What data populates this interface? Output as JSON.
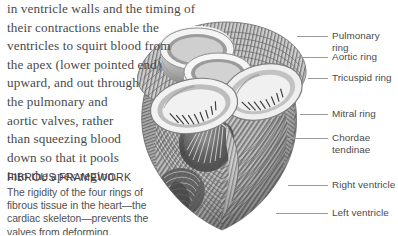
{
  "page": {
    "width": 398,
    "height": 235,
    "background": "#ffffff"
  },
  "body_copy": {
    "text": "in ventricle walls and the timing of their contractions enable the\nventricles to squirt blood from\nthe apex (lower pointed end)\nupward, and out through\nthe pulmonary and\naortic valves, rather\nthan squeezing blood\ndown so that it pools\ninto the apex region.",
    "color": "#4a4a4a"
  },
  "caption": {
    "heading": "FIBROUS FRAMEWORK",
    "text": "The rigidity of the four rings of\nfibrous tissue in the heart—the\ncardiac skeleton—prevents the\nvalves from deforming.",
    "heading_color": "#3d3d3d",
    "text_color": "#4f4f4f"
  },
  "callouts": [
    {
      "label": "Pulmonary ring",
      "label_x": 332,
      "label_y": 30,
      "line_x": 297,
      "line_y": 36,
      "line_w": 31
    },
    {
      "label": "Aortic ring",
      "label_x": 332,
      "label_y": 51,
      "line_x": 297,
      "line_y": 57,
      "line_w": 31
    },
    {
      "label": "Tricuspid ring",
      "label_x": 332,
      "label_y": 72,
      "line_x": 308,
      "line_y": 78,
      "line_w": 20
    },
    {
      "label": "Mitral ring",
      "label_x": 332,
      "label_y": 108,
      "line_x": 300,
      "line_y": 114,
      "line_w": 28
    },
    {
      "label": "Chordae\ntendinae",
      "label_x": 332,
      "label_y": 132,
      "line_x": 289,
      "line_y": 138,
      "line_w": 39
    },
    {
      "label": "Right ventricle",
      "label_x": 332,
      "label_y": 179,
      "line_x": 288,
      "line_y": 185,
      "line_w": 40
    },
    {
      "label": "Left ventricle",
      "label_x": 332,
      "label_y": 207,
      "line_x": 276,
      "line_y": 213,
      "line_w": 52
    }
  ],
  "illustration": {
    "name": "heart-fibrous-skeleton-illustration",
    "description": "Grayscale anatomical cutaway of the heart showing four fibrous valve rings and spiral muscle bands",
    "tone_dark": "#3a3a3a",
    "tone_mid": "#8d8d8d",
    "tone_light": "#d8d8d8",
    "tone_highlight": "#f2f2f2"
  }
}
